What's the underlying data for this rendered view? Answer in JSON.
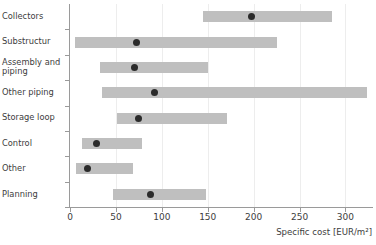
{
  "chart_data": {
    "type": "bar",
    "subtype": "range-bar-with-median-marker",
    "title": "",
    "xlabel": "Specific cost [EUR/m²]",
    "ylabel": "",
    "xlim": [
      0,
      330
    ],
    "xticks": [
      0,
      50,
      100,
      150,
      200,
      250,
      300
    ],
    "xtick_labels": [
      "0",
      "50",
      "100",
      "150",
      "200",
      "250",
      "300"
    ],
    "grid": "vertical-only",
    "legend": "none",
    "orientation": "horizontal",
    "bar_color": "#bfbfbf",
    "marker_color": "#2b2b2b",
    "categories": [
      "Collectors",
      "Substructur",
      "Assembly and piping",
      "Other piping",
      "Storage loop",
      "Control",
      "Other",
      "Planning"
    ],
    "series": [
      {
        "name": "Cost range (low–high)",
        "low": [
          145,
          5,
          33,
          35,
          51,
          13,
          6,
          47
        ],
        "high": [
          285,
          225,
          150,
          323,
          171,
          78,
          69,
          148
        ]
      },
      {
        "name": "Typical / median specific cost",
        "values": [
          198,
          72,
          70,
          92,
          75,
          29,
          19,
          88
        ]
      }
    ],
    "rows": [
      {
        "label": "Collectors",
        "label_display": "Collectors",
        "low": 145,
        "high": 285,
        "median": 198
      },
      {
        "label": "Substructur",
        "label_display": "Substructur",
        "low": 5,
        "high": 225,
        "median": 72
      },
      {
        "label": "Assembly and piping",
        "label_display": "Assembly and\npiping",
        "low": 33,
        "high": 150,
        "median": 70
      },
      {
        "label": "Other piping",
        "label_display": "Other piping",
        "low": 35,
        "high": 323,
        "median": 92
      },
      {
        "label": "Storage loop",
        "label_display": "Storage loop",
        "low": 51,
        "high": 171,
        "median": 75
      },
      {
        "label": "Control",
        "label_display": "Control",
        "low": 13,
        "high": 78,
        "median": 29
      },
      {
        "label": "Other",
        "label_display": "Other",
        "low": 6,
        "high": 69,
        "median": 19
      },
      {
        "label": "Planning",
        "label_display": "Planning",
        "low": 47,
        "high": 148,
        "median": 88
      }
    ]
  }
}
